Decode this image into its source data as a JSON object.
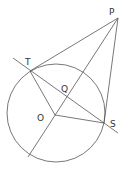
{
  "diagram": {
    "colors": {
      "stroke": "#555555",
      "label": "#333333",
      "background": "#ffffff"
    },
    "points": {
      "P": {
        "label": "P",
        "x": 118,
        "y": 18
      },
      "T": {
        "label": "T",
        "x": 30,
        "y": 71
      },
      "S": {
        "label": "S",
        "x": 104,
        "y": 123
      },
      "O": {
        "label": "O",
        "x": 55,
        "y": 115
      },
      "Q": {
        "label": "Q"
      }
    },
    "circle": {
      "center": "O",
      "radius": 49
    },
    "labels": {
      "P": "P",
      "T": "T",
      "S": "S",
      "O": "O",
      "Q": "Q"
    }
  }
}
